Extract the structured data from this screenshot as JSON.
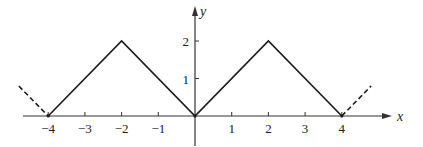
{
  "chart_data": {
    "type": "line",
    "title": "",
    "xlabel": "x",
    "ylabel": "y",
    "xlim": [
      -4.8,
      5.4
    ],
    "ylim": [
      -0.8,
      2.9
    ],
    "grid": false,
    "legend": null,
    "x_ticks": [
      -4,
      -3,
      -2,
      -1,
      1,
      2,
      3,
      4
    ],
    "x_tick_labels": [
      "−4",
      "−3",
      "−2",
      "−1",
      "1",
      "2",
      "3",
      "4"
    ],
    "y_ticks": [
      1,
      2
    ],
    "y_tick_labels": [
      "1",
      "2"
    ],
    "series": [
      {
        "name": "periodic triangle wave (solid)",
        "style": "solid",
        "x": [
          -4,
          -2,
          0,
          2,
          4
        ],
        "y": [
          0,
          2,
          0,
          2,
          0
        ]
      },
      {
        "name": "continuation left (dashed)",
        "style": "dashed",
        "x": [
          -4.8,
          -4
        ],
        "y": [
          0.8,
          0
        ]
      },
      {
        "name": "continuation right (dashed)",
        "style": "dashed",
        "x": [
          4,
          4.8
        ],
        "y": [
          0,
          0.8
        ]
      }
    ]
  },
  "layout": {
    "origin_px": [
      195,
      116
    ],
    "px_per_unit_x": 36.7,
    "px_per_unit_y": 37.5,
    "x_axis_start_px": 23,
    "x_axis_end_px": 392,
    "y_axis_top_px": 6,
    "y_axis_bottom_px": 146,
    "line_color": "#1a1a1a",
    "axis_color": "#333333"
  }
}
